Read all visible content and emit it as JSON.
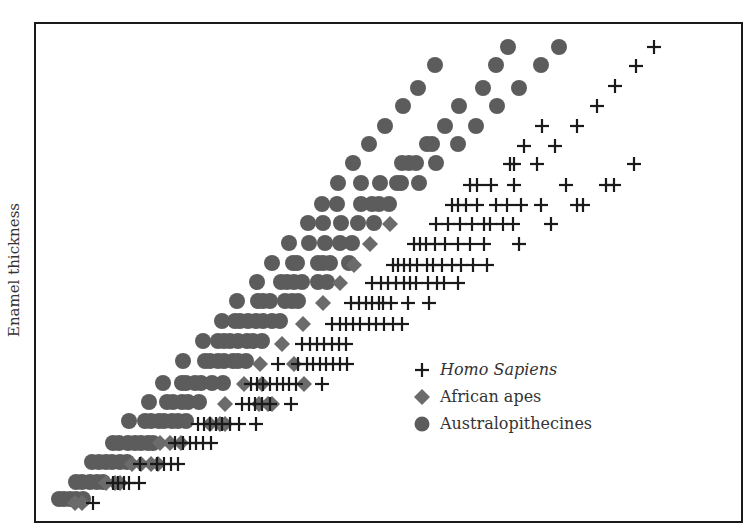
{
  "chart_data": {
    "type": "scatter",
    "title": "",
    "xlabel": "",
    "ylabel": "Enamel thickness",
    "axis_ticks": "none",
    "grid": false,
    "legend_position": "lower-right inside plot",
    "marker_size_px": 15,
    "series": [
      {
        "name": "Homo Sapiens",
        "marker": "plus",
        "color": "#1a1a1a",
        "italic": true,
        "points_px": [
          [
            654,
            47
          ],
          [
            636,
            66
          ],
          [
            615,
            86
          ],
          [
            597,
            106
          ],
          [
            542,
            126
          ],
          [
            577,
            126
          ],
          [
            524,
            146
          ],
          [
            555,
            146
          ],
          [
            510,
            164
          ],
          [
            514,
            164
          ],
          [
            537,
            164
          ],
          [
            634,
            164
          ],
          [
            470,
            185
          ],
          [
            477,
            185
          ],
          [
            491,
            185
          ],
          [
            514,
            185
          ],
          [
            566,
            185
          ],
          [
            606,
            185
          ],
          [
            614,
            185
          ],
          [
            452,
            205
          ],
          [
            458,
            205
          ],
          [
            466,
            205
          ],
          [
            477,
            205
          ],
          [
            496,
            205
          ],
          [
            507,
            205
          ],
          [
            521,
            205
          ],
          [
            541,
            205
          ],
          [
            577,
            205
          ],
          [
            583,
            205
          ],
          [
            436,
            224
          ],
          [
            448,
            224
          ],
          [
            460,
            224
          ],
          [
            472,
            224
          ],
          [
            484,
            224
          ],
          [
            490,
            224
          ],
          [
            503,
            224
          ],
          [
            513,
            224
          ],
          [
            551,
            224
          ],
          [
            414,
            244
          ],
          [
            420,
            244
          ],
          [
            426,
            244
          ],
          [
            435,
            244
          ],
          [
            445,
            244
          ],
          [
            458,
            244
          ],
          [
            470,
            244
          ],
          [
            484,
            244
          ],
          [
            519,
            244
          ],
          [
            393,
            265
          ],
          [
            398,
            265
          ],
          [
            404,
            265
          ],
          [
            410,
            265
          ],
          [
            417,
            265
          ],
          [
            427,
            265
          ],
          [
            433,
            265
          ],
          [
            442,
            265
          ],
          [
            452,
            265
          ],
          [
            461,
            265
          ],
          [
            473,
            265
          ],
          [
            487,
            265
          ],
          [
            372,
            283
          ],
          [
            381,
            283
          ],
          [
            388,
            283
          ],
          [
            396,
            283
          ],
          [
            404,
            283
          ],
          [
            410,
            283
          ],
          [
            416,
            283
          ],
          [
            428,
            283
          ],
          [
            437,
            283
          ],
          [
            444,
            283
          ],
          [
            458,
            283
          ],
          [
            351,
            303
          ],
          [
            359,
            303
          ],
          [
            366,
            303
          ],
          [
            372,
            303
          ],
          [
            379,
            303
          ],
          [
            383,
            303
          ],
          [
            391,
            303
          ],
          [
            408,
            303
          ],
          [
            429,
            303
          ],
          [
            332,
            324
          ],
          [
            340,
            324
          ],
          [
            346,
            324
          ],
          [
            353,
            324
          ],
          [
            360,
            324
          ],
          [
            369,
            324
          ],
          [
            376,
            324
          ],
          [
            384,
            324
          ],
          [
            393,
            324
          ],
          [
            402,
            324
          ],
          [
            302,
            344
          ],
          [
            310,
            344
          ],
          [
            317,
            344
          ],
          [
            324,
            344
          ],
          [
            332,
            344
          ],
          [
            339,
            344
          ],
          [
            346,
            344
          ],
          [
            278,
            364
          ],
          [
            298,
            364
          ],
          [
            307,
            364
          ],
          [
            313,
            364
          ],
          [
            320,
            364
          ],
          [
            326,
            364
          ],
          [
            333,
            364
          ],
          [
            340,
            364
          ],
          [
            347,
            364
          ],
          [
            251,
            384
          ],
          [
            257,
            384
          ],
          [
            263,
            384
          ],
          [
            270,
            384
          ],
          [
            277,
            384
          ],
          [
            283,
            384
          ],
          [
            289,
            384
          ],
          [
            296,
            384
          ],
          [
            322,
            384
          ],
          [
            242,
            404
          ],
          [
            249,
            404
          ],
          [
            255,
            404
          ],
          [
            262,
            404
          ],
          [
            270,
            404
          ],
          [
            291,
            404
          ],
          [
            198,
            424
          ],
          [
            204,
            424
          ],
          [
            210,
            424
          ],
          [
            216,
            424
          ],
          [
            222,
            424
          ],
          [
            230,
            424
          ],
          [
            239,
            424
          ],
          [
            256,
            424
          ],
          [
            175,
            443
          ],
          [
            183,
            443
          ],
          [
            190,
            443
          ],
          [
            196,
            443
          ],
          [
            203,
            443
          ],
          [
            211,
            443
          ],
          [
            140,
            464
          ],
          [
            157,
            464
          ],
          [
            164,
            464
          ],
          [
            171,
            464
          ],
          [
            178,
            464
          ],
          [
            113,
            483
          ],
          [
            118,
            483
          ],
          [
            124,
            483
          ],
          [
            129,
            483
          ],
          [
            139,
            483
          ],
          [
            93,
            503
          ]
        ]
      },
      {
        "name": "African apes",
        "marker": "diamond",
        "color": "#6b6b6b",
        "italic": false,
        "points_px": [
          [
            390,
            224
          ],
          [
            370,
            244
          ],
          [
            354,
            265
          ],
          [
            340,
            283
          ],
          [
            323,
            303
          ],
          [
            303,
            324
          ],
          [
            282,
            344
          ],
          [
            260,
            364
          ],
          [
            294,
            364
          ],
          [
            244,
            384
          ],
          [
            262,
            384
          ],
          [
            304,
            384
          ],
          [
            225,
            404
          ],
          [
            259,
            404
          ],
          [
            268,
            404
          ],
          [
            272,
            404
          ],
          [
            210,
            424
          ],
          [
            220,
            424
          ],
          [
            225,
            424
          ],
          [
            160,
            443
          ],
          [
            170,
            443
          ],
          [
            181,
            443
          ],
          [
            132,
            464
          ],
          [
            141,
            464
          ],
          [
            151,
            464
          ],
          [
            158,
            464
          ],
          [
            106,
            483
          ],
          [
            115,
            483
          ],
          [
            120,
            483
          ],
          [
            75,
            503
          ],
          [
            82,
            503
          ]
        ]
      },
      {
        "name": "Australopithecines",
        "marker": "circle",
        "color": "#5c5c5c",
        "italic": false,
        "points_px": [
          [
            508,
            47
          ],
          [
            559,
            47
          ],
          [
            435,
            65
          ],
          [
            496,
            65
          ],
          [
            541,
            65
          ],
          [
            418,
            88
          ],
          [
            483,
            88
          ],
          [
            519,
            88
          ],
          [
            403,
            106
          ],
          [
            459,
            106
          ],
          [
            497,
            106
          ],
          [
            385,
            126
          ],
          [
            445,
            126
          ],
          [
            476,
            126
          ],
          [
            369,
            144
          ],
          [
            427,
            144
          ],
          [
            432,
            144
          ],
          [
            458,
            144
          ],
          [
            353,
            163
          ],
          [
            402,
            163
          ],
          [
            409,
            163
          ],
          [
            416,
            163
          ],
          [
            436,
            163
          ],
          [
            338,
            183
          ],
          [
            361,
            183
          ],
          [
            380,
            183
          ],
          [
            397,
            183
          ],
          [
            401,
            183
          ],
          [
            419,
            183
          ],
          [
            322,
            204
          ],
          [
            337,
            204
          ],
          [
            361,
            204
          ],
          [
            372,
            204
          ],
          [
            379,
            204
          ],
          [
            389,
            204
          ],
          [
            308,
            223
          ],
          [
            323,
            223
          ],
          [
            341,
            223
          ],
          [
            358,
            223
          ],
          [
            374,
            223
          ],
          [
            289,
            243
          ],
          [
            309,
            243
          ],
          [
            325,
            243
          ],
          [
            340,
            243
          ],
          [
            352,
            243
          ],
          [
            272,
            263
          ],
          [
            293,
            263
          ],
          [
            297,
            263
          ],
          [
            318,
            263
          ],
          [
            323,
            263
          ],
          [
            330,
            263
          ],
          [
            349,
            263
          ],
          [
            257,
            282
          ],
          [
            281,
            282
          ],
          [
            287,
            282
          ],
          [
            294,
            282
          ],
          [
            302,
            282
          ],
          [
            318,
            282
          ],
          [
            327,
            282
          ],
          [
            237,
            301
          ],
          [
            258,
            301
          ],
          [
            263,
            301
          ],
          [
            270,
            301
          ],
          [
            285,
            301
          ],
          [
            292,
            301
          ],
          [
            298,
            301
          ],
          [
            222,
            321
          ],
          [
            235,
            321
          ],
          [
            240,
            321
          ],
          [
            248,
            321
          ],
          [
            256,
            321
          ],
          [
            263,
            321
          ],
          [
            272,
            321
          ],
          [
            280,
            321
          ],
          [
            203,
            341
          ],
          [
            218,
            341
          ],
          [
            224,
            341
          ],
          [
            230,
            341
          ],
          [
            238,
            341
          ],
          [
            247,
            341
          ],
          [
            253,
            341
          ],
          [
            262,
            341
          ],
          [
            183,
            361
          ],
          [
            205,
            361
          ],
          [
            210,
            361
          ],
          [
            218,
            361
          ],
          [
            224,
            361
          ],
          [
            233,
            361
          ],
          [
            238,
            361
          ],
          [
            246,
            361
          ],
          [
            163,
            383
          ],
          [
            182,
            383
          ],
          [
            186,
            383
          ],
          [
            195,
            383
          ],
          [
            201,
            383
          ],
          [
            212,
            383
          ],
          [
            223,
            383
          ],
          [
            149,
            402
          ],
          [
            167,
            402
          ],
          [
            173,
            402
          ],
          [
            182,
            402
          ],
          [
            188,
            402
          ],
          [
            199,
            402
          ],
          [
            129,
            421
          ],
          [
            145,
            421
          ],
          [
            151,
            421
          ],
          [
            159,
            421
          ],
          [
            164,
            421
          ],
          [
            172,
            421
          ],
          [
            178,
            421
          ],
          [
            186,
            421
          ],
          [
            113,
            443
          ],
          [
            119,
            443
          ],
          [
            128,
            443
          ],
          [
            135,
            443
          ],
          [
            141,
            443
          ],
          [
            148,
            443
          ],
          [
            153,
            443
          ],
          [
            92,
            462
          ],
          [
            99,
            462
          ],
          [
            106,
            462
          ],
          [
            112,
            462
          ],
          [
            120,
            462
          ],
          [
            127,
            462
          ],
          [
            76,
            482
          ],
          [
            82,
            482
          ],
          [
            90,
            482
          ],
          [
            97,
            482
          ],
          [
            103,
            482
          ],
          [
            59,
            499
          ],
          [
            64,
            499
          ],
          [
            70,
            499
          ],
          [
            76,
            499
          ],
          [
            83,
            499
          ]
        ]
      }
    ]
  },
  "legend": {
    "items": [
      {
        "label": "Homo Sapiens",
        "marker": "plus"
      },
      {
        "label": "African apes",
        "marker": "diamond"
      },
      {
        "label": "Australopithecines",
        "marker": "circle"
      }
    ]
  },
  "axes": {
    "ylabel": "Enamel thickness"
  }
}
